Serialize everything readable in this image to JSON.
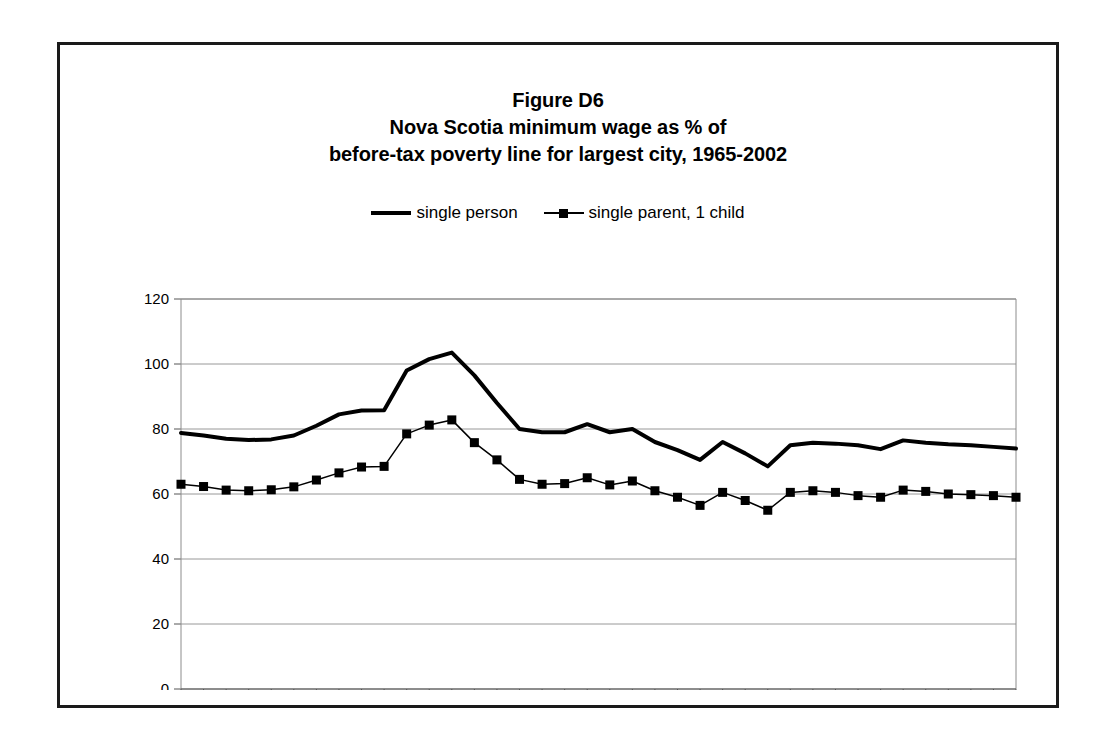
{
  "figure": {
    "title_lines": [
      "Figure D6",
      "Nova Scotia minimum wage as % of",
      "before-tax poverty line for largest city, 1965-2002"
    ]
  },
  "legend": {
    "items": [
      {
        "label": "single person",
        "marker": "none",
        "color": "#000000"
      },
      {
        "label": "single parent, 1 child",
        "marker": "square",
        "color": "#000000"
      }
    ]
  },
  "chart_data": {
    "type": "line",
    "xlabel": "",
    "ylabel": "",
    "grid": true,
    "legend_position": "top",
    "xlim": [
      1965,
      2002
    ],
    "ylim": [
      0,
      120
    ],
    "ytick_values": [
      0,
      20,
      40,
      60,
      80,
      100,
      120
    ],
    "ytick_labels": [
      "0",
      "20",
      "40",
      "60",
      "80",
      "100",
      "120"
    ],
    "xtick_values": [
      1965,
      1970,
      1975,
      1980,
      1985,
      1990,
      1995,
      2000,
      2002
    ],
    "xtick_labels": [
      "1965",
      "70",
      "75",
      "80",
      "85",
      "90",
      "95",
      "2000",
      "02"
    ],
    "x": [
      1965,
      1966,
      1967,
      1968,
      1969,
      1970,
      1971,
      1972,
      1973,
      1974,
      1975,
      1976,
      1977,
      1978,
      1979,
      1980,
      1981,
      1982,
      1983,
      1984,
      1985,
      1986,
      1987,
      1988,
      1989,
      1990,
      1991,
      1992,
      1993,
      1994,
      1995,
      1996,
      1997,
      1998,
      1999,
      2000,
      2001,
      2002
    ],
    "series": [
      {
        "name": "single person",
        "marker": "none",
        "color": "#000000",
        "width": 4,
        "values": [
          78.8,
          78.0,
          77.0,
          76.6,
          76.8,
          78.0,
          81.0,
          84.5,
          85.7,
          85.8,
          98.0,
          101.5,
          103.5,
          96.5,
          88.0,
          80.0,
          79.0,
          79.0,
          81.5,
          79.0,
          80.0,
          76.0,
          73.5,
          70.5,
          76.0,
          72.5,
          68.5,
          75.0,
          75.8,
          75.5,
          75.0,
          73.8,
          76.5,
          75.8,
          75.3,
          75.0,
          74.5,
          74.0
        ]
      },
      {
        "name": "single parent, 1 child",
        "marker": "square",
        "color": "#000000",
        "width": 1.5,
        "values": [
          63.0,
          62.3,
          61.2,
          61.0,
          61.3,
          62.2,
          64.3,
          66.5,
          68.3,
          68.5,
          78.5,
          81.2,
          82.8,
          75.8,
          70.5,
          64.5,
          63.0,
          63.2,
          65.0,
          62.8,
          64.0,
          61.0,
          59.0,
          56.5,
          60.5,
          58.0,
          55.0,
          60.5,
          61.0,
          60.5,
          59.5,
          59.0,
          61.2,
          60.8,
          60.0,
          59.8,
          59.5,
          59.0
        ]
      }
    ]
  }
}
